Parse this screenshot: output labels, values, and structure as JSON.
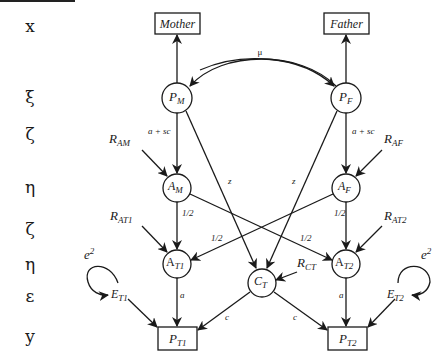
{
  "row_labels": [
    "x",
    "ξ",
    "ζ",
    "η",
    "ζ",
    "η",
    "ε",
    "y"
  ],
  "observed": {
    "mother": "Mother",
    "father": "Father",
    "pt1": {
      "base": "P",
      "sub": "T1"
    },
    "pt2": {
      "base": "P",
      "sub": "T2"
    }
  },
  "latent": {
    "pm": {
      "base": "P",
      "sub": "M"
    },
    "pf": {
      "base": "P",
      "sub": "F"
    },
    "am": {
      "base": "A",
      "sub": "M"
    },
    "af": {
      "base": "A",
      "sub": "F"
    },
    "at1": {
      "base": "A",
      "sub": "T1"
    },
    "at2": {
      "base": "A",
      "sub": "T2"
    },
    "ct": {
      "base": "C",
      "sub": "T"
    }
  },
  "residuals": {
    "ram": {
      "base": "R",
      "sub": "AM"
    },
    "raf": {
      "base": "R",
      "sub": "AF"
    },
    "rat1": {
      "base": "R",
      "sub": "AT1"
    },
    "rat2": {
      "base": "R",
      "sub": "AT2"
    },
    "rct": {
      "base": "R",
      "sub": "CT"
    },
    "et1": {
      "base": "E",
      "sub": "T1"
    },
    "et2": {
      "base": "E",
      "sub": "T2"
    }
  },
  "paths": {
    "mu": "μ",
    "a_plus_sc": "a + sc",
    "half": "1/2",
    "z": "z",
    "a": "a",
    "c": "c",
    "e2_base": "e",
    "e2_sup": "2"
  }
}
